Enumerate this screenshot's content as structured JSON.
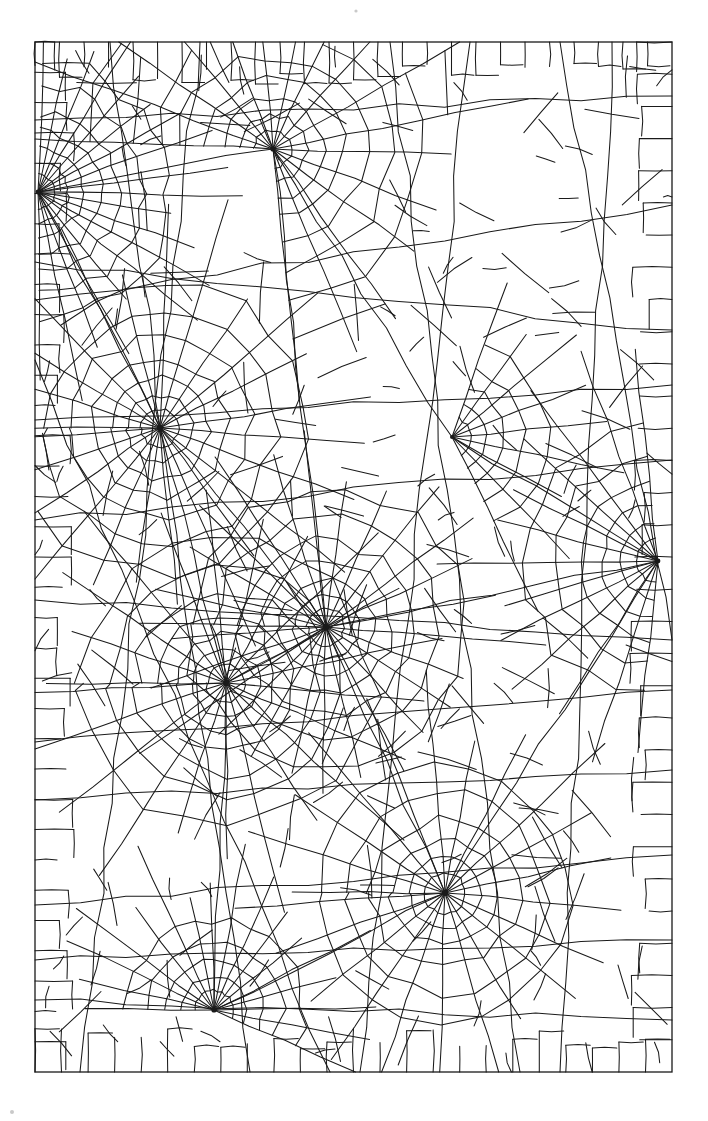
{
  "page": {
    "width": 708,
    "height": 1121,
    "background_color": "#ffffff",
    "ink_color": "#1a1a1a"
  },
  "frame": {
    "name": "web-border-rectangle",
    "x": 35,
    "y": 42,
    "width": 637,
    "height": 1030,
    "stroke_width": 1.3
  },
  "artwork": {
    "type": "orb-web-network",
    "description": "Black line drawing of an interconnected spider web with multiple radial hubs and connecting spiral threads inside a rectangular border",
    "hub_count": 9,
    "line_color": "#1a1a1a",
    "line_width": 1.05
  },
  "hubs": [
    {
      "id": "hub-left-upper",
      "label": "Left upper hub",
      "cx": 38,
      "cy": 192,
      "spokes": 19,
      "rings": 7,
      "r_start": 6,
      "r_step": 20,
      "a_start": -86,
      "a_end": 88,
      "jitter": 2.6,
      "core": 2.4
    },
    {
      "id": "hub-top",
      "label": "Top hub",
      "cx": 273,
      "cy": 149,
      "spokes": 17,
      "rings": 8,
      "r_start": 6,
      "r_step": 23,
      "a_start": -178,
      "a_end": 86,
      "jitter": 2.8,
      "core": 2.6
    },
    {
      "id": "hub-mid-left",
      "label": "Middle left hub",
      "cx": 160,
      "cy": 428,
      "spokes": 24,
      "rings": 7,
      "r_start": 7,
      "r_step": 22,
      "a_start": -180,
      "a_end": 176,
      "jitter": 3.0,
      "core": 3.0
    },
    {
      "id": "hub-center",
      "label": "Center hub",
      "cx": 326,
      "cy": 627,
      "spokes": 26,
      "rings": 7,
      "r_start": 7,
      "r_step": 21,
      "a_start": -180,
      "a_end": 176,
      "jitter": 2.8,
      "core": 3.2
    },
    {
      "id": "hub-lower-left",
      "label": "Lower left hub",
      "cx": 226,
      "cy": 683,
      "spokes": 22,
      "rings": 7,
      "r_start": 7,
      "r_step": 22,
      "a_start": -180,
      "a_end": 176,
      "jitter": 3.0,
      "core": 2.9
    },
    {
      "id": "hub-right-edge",
      "label": "Right edge hub",
      "cx": 658,
      "cy": 561,
      "spokes": 13,
      "rings": 6,
      "r_start": 7,
      "r_step": 26,
      "a_start": 96,
      "a_end": 262,
      "jitter": 2.6,
      "core": 2.4
    },
    {
      "id": "hub-lower-right",
      "label": "Lower right hub",
      "cx": 445,
      "cy": 893,
      "spokes": 22,
      "rings": 6,
      "r_start": 7,
      "r_step": 24,
      "a_start": -180,
      "a_end": 176,
      "jitter": 3.2,
      "core": 3.0
    },
    {
      "id": "hub-bottom",
      "label": "Bottom hub",
      "cx": 214,
      "cy": 1010,
      "spokes": 17,
      "rings": 5,
      "r_start": 7,
      "r_step": 22,
      "a_start": -180,
      "a_end": 24,
      "jitter": 2.6,
      "core": 2.6
    },
    {
      "id": "hub-upper-right",
      "label": "Upper right small hub",
      "cx": 452,
      "cy": 437,
      "spokes": 9,
      "rings": 5,
      "r_start": 6,
      "r_step": 24,
      "a_start": -72,
      "a_end": 64,
      "jitter": 2.4,
      "core": 2.0
    }
  ],
  "bridge_threads": [
    {
      "id": "thread-top-left-to-top",
      "from": [
        38,
        192
      ],
      "to": [
        273,
        149
      ]
    },
    {
      "id": "thread-top-to-center",
      "from": [
        273,
        149
      ],
      "to": [
        326,
        627
      ]
    },
    {
      "id": "thread-left-to-midleft",
      "from": [
        38,
        192
      ],
      "to": [
        160,
        428
      ]
    },
    {
      "id": "thread-midleft-to-center",
      "from": [
        160,
        428
      ],
      "to": [
        326,
        627
      ]
    },
    {
      "id": "thread-midleft-to-lowerleft",
      "from": [
        160,
        428
      ],
      "to": [
        226,
        683
      ]
    },
    {
      "id": "thread-center-to-lowerleft",
      "from": [
        326,
        627
      ],
      "to": [
        226,
        683
      ]
    },
    {
      "id": "thread-center-to-right",
      "from": [
        326,
        627
      ],
      "to": [
        658,
        561
      ]
    },
    {
      "id": "thread-center-to-lowerright",
      "from": [
        326,
        627
      ],
      "to": [
        445,
        893
      ]
    },
    {
      "id": "thread-lowerleft-to-bottom",
      "from": [
        226,
        683
      ],
      "to": [
        214,
        1010
      ]
    },
    {
      "id": "thread-lowerright-to-bottom",
      "from": [
        445,
        893
      ],
      "to": [
        214,
        1010
      ]
    },
    {
      "id": "thread-right-to-lowerright",
      "from": [
        658,
        561
      ],
      "to": [
        445,
        893
      ]
    },
    {
      "id": "thread-top-to-upperright",
      "from": [
        273,
        149
      ],
      "to": [
        452,
        437
      ]
    },
    {
      "id": "thread-upperright-to-right",
      "from": [
        452,
        437
      ],
      "to": [
        658,
        561
      ]
    }
  ],
  "specks": [
    {
      "id": "speck-top",
      "cx": 356,
      "cy": 11,
      "r": 1.6
    },
    {
      "id": "speck-bottom-left",
      "cx": 12,
      "cy": 1112,
      "r": 2.0
    }
  ]
}
